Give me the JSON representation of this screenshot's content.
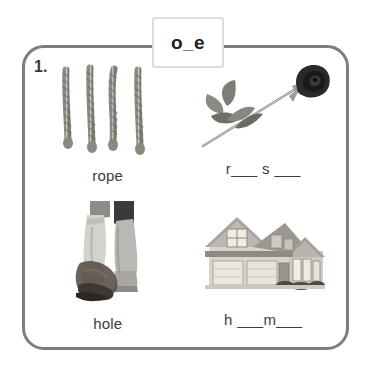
{
  "header": {
    "pattern": "o_e"
  },
  "worksheet": {
    "number": "1.",
    "border_color": "#7d7d7d",
    "pattern_box_border_color": "#dcdcdc",
    "text_color": "#3c3c3c"
  },
  "cells": [
    {
      "image": "rope-photo",
      "caption": "rope",
      "type": "labeled"
    },
    {
      "image": "rose-photo",
      "caption": "r___ s ___",
      "type": "fill-in-blank"
    },
    {
      "image": "boots-in-hole-photo",
      "caption": "hole",
      "type": "labeled"
    },
    {
      "image": "house-photo",
      "caption": "h ___m___",
      "type": "fill-in-blank"
    }
  ]
}
